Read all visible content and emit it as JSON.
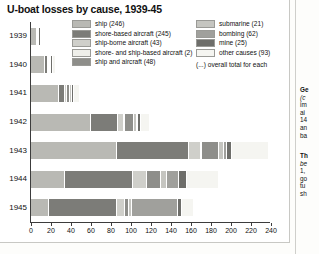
{
  "chart_data": {
    "type": "bar",
    "orientation": "horizontal",
    "stacked": true,
    "title": "U-boat losses by cause, 1939-45",
    "xlabel": "",
    "ylabel": "",
    "xlim": [
      0,
      240
    ],
    "xticks": [
      0,
      20,
      40,
      60,
      80,
      100,
      120,
      140,
      160,
      180,
      200,
      220,
      240
    ],
    "grid": false,
    "legend_position": "top",
    "categories": [
      "1939",
      "1940",
      "1941",
      "1942",
      "1943",
      "1944",
      "1945"
    ],
    "series": [
      {
        "name": "ship",
        "total": 246,
        "color": "#b9b9b4",
        "values": [
          6,
          14,
          28,
          60,
          86,
          34,
          18
        ]
      },
      {
        "name": "shore-based aircraft",
        "total": 245,
        "color": "#7c7c78",
        "values": [
          1,
          3,
          6,
          27,
          72,
          68,
          68
        ]
      },
      {
        "name": "ship-borne aircraft",
        "total": 43,
        "color": "#cfcfca",
        "values": [
          0,
          1,
          2,
          6,
          12,
          14,
          8
        ]
      },
      {
        "name": "shore- and ship-based aircraft",
        "total": 2,
        "color": "#efefea",
        "values": [
          0,
          0,
          0,
          1,
          1,
          0,
          0
        ]
      },
      {
        "name": "ship and aircraft",
        "total": 48,
        "color": "#8e8e8a",
        "values": [
          0,
          1,
          3,
          9,
          17,
          14,
          4
        ]
      },
      {
        "name": "submarine",
        "total": 21,
        "color": "#c5c5c0",
        "values": [
          1,
          1,
          2,
          3,
          5,
          6,
          3
        ]
      },
      {
        "name": "bombing",
        "total": 62,
        "color": "#a0a09c",
        "values": [
          0,
          0,
          0,
          1,
          3,
          12,
          46
        ]
      },
      {
        "name": "mine",
        "total": 25,
        "color": "#6e6e6a",
        "values": [
          1,
          2,
          2,
          3,
          5,
          8,
          4
        ]
      },
      {
        "name": "other causes",
        "total": 93,
        "color": "#f5f5f1",
        "values": [
          0,
          2,
          5,
          8,
          36,
          31,
          11
        ]
      }
    ],
    "totals": [
      9,
      24,
      48,
      118,
      237,
      187,
      162
    ]
  },
  "header": {
    "title": "U-boat losses by cause, 1939-45"
  },
  "legend": {
    "left_items": [
      {
        "label": "ship (246)",
        "color": "#b9b9b4"
      },
      {
        "label": "shore-based aircraft (245)",
        "color": "#7c7c78"
      },
      {
        "label": "ship-borne aircraft (43)",
        "color": "#cfcfca"
      },
      {
        "label": "shore- and ship-based aircraft (2)",
        "color": "#efefea"
      },
      {
        "label": "ship and aircraft (48)",
        "color": "#8e8e8a"
      }
    ],
    "right_items": [
      {
        "label": "submarine (21)",
        "color": "#c5c5c0"
      },
      {
        "label": "bombing (62)",
        "color": "#a0a09c"
      },
      {
        "label": "mine (25)",
        "color": "#6e6e6a"
      },
      {
        "label": "other causes (93)",
        "color": "#f5f5f1"
      }
    ],
    "note": "(...) overall total for each"
  },
  "axis": {
    "ticks": [
      "0",
      "20",
      "40",
      "60",
      "80",
      "100",
      "120",
      "140",
      "160",
      "180",
      "200",
      "220",
      "240"
    ],
    "years": [
      "1939",
      "1940",
      "1941",
      "1942",
      "1943",
      "1944",
      "1945"
    ]
  },
  "side_panel": {
    "block_1": {
      "head": "Ge",
      "lines": [
        "(c",
        "im",
        "ai",
        "14",
        "an",
        "ba"
      ]
    },
    "block_2": {
      "head": "Th",
      "lines": [
        "be",
        "1,",
        "go",
        "tu",
        "sh"
      ]
    }
  }
}
